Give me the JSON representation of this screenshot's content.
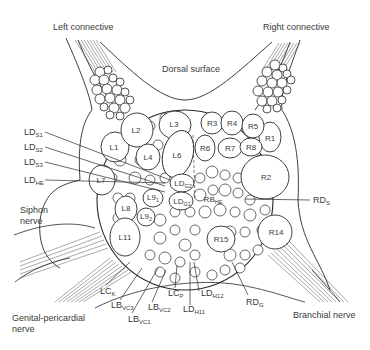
{
  "figure": {
    "type": "anatomical-diagram",
    "regions": {
      "top_center": "Dorsal surface",
      "top_left": "Left connective",
      "top_right": "Right connective",
      "left": "Siphon nerve",
      "bottom_left": "Genital-pericardial nerve",
      "bottom_right": "Branchial nerve"
    },
    "cells_left_hemiganglion": [
      {
        "id": "L1",
        "main": "L1",
        "sub": ""
      },
      {
        "id": "L2",
        "main": "L2",
        "sub": ""
      },
      {
        "id": "L3",
        "main": "L3",
        "sub": ""
      },
      {
        "id": "L4",
        "main": "L4",
        "sub": ""
      },
      {
        "id": "L6",
        "main": "L6",
        "sub": ""
      },
      {
        "id": "L7",
        "main": "L7",
        "sub": ""
      },
      {
        "id": "L8",
        "main": "L8",
        "sub": ""
      },
      {
        "id": "L9_1",
        "main": "L9",
        "sub": "1"
      },
      {
        "id": "L9_2",
        "main": "L9",
        "sub": "2"
      },
      {
        "id": "L11",
        "main": "L11",
        "sub": ""
      },
      {
        "id": "LD_G2",
        "main": "LD",
        "sub": "G2"
      },
      {
        "id": "LD_G1",
        "main": "LD",
        "sub": "G1"
      }
    ],
    "cells_right_hemiganglion": [
      {
        "id": "R1",
        "main": "R1",
        "sub": ""
      },
      {
        "id": "R2",
        "main": "R2",
        "sub": ""
      },
      {
        "id": "R3",
        "main": "R3",
        "sub": ""
      },
      {
        "id": "R4",
        "main": "R4",
        "sub": ""
      },
      {
        "id": "R5",
        "main": "R5",
        "sub": ""
      },
      {
        "id": "R6",
        "main": "R6",
        "sub": ""
      },
      {
        "id": "R7",
        "main": "R7",
        "sub": ""
      },
      {
        "id": "R8",
        "main": "R8",
        "sub": ""
      },
      {
        "id": "R14",
        "main": "R14",
        "sub": ""
      },
      {
        "id": "R15",
        "main": "R15",
        "sub": ""
      },
      {
        "id": "RB_HE",
        "main": "RB",
        "sub": "HE"
      }
    ],
    "callouts_left": [
      {
        "main": "LD",
        "sub": "S1"
      },
      {
        "main": "LD",
        "sub": "S2"
      },
      {
        "main": "LD",
        "sub": "S3"
      },
      {
        "main": "LD",
        "sub": "HE"
      }
    ],
    "callouts_right": [
      {
        "main": "RD",
        "sub": "S"
      }
    ],
    "callouts_bottom": [
      {
        "main": "LC",
        "sub": "K"
      },
      {
        "main": "LB",
        "sub": "VC3"
      },
      {
        "main": "LB",
        "sub": "VC1"
      },
      {
        "main": "LB",
        "sub": "VC2"
      },
      {
        "main": "LC",
        "sub": "P"
      },
      {
        "main": "LD",
        "sub": "H11"
      },
      {
        "main": "LD",
        "sub": "H12"
      },
      {
        "main": "RD",
        "sub": "G"
      }
    ],
    "colors": {
      "line": "#2a2a2a",
      "text": "#3a3a3a",
      "background": "#ffffff"
    }
  }
}
